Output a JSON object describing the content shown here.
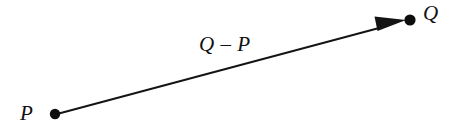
{
  "figure": {
    "type": "vector-diagram",
    "background_color": "#ffffff",
    "stroke_color": "#141414",
    "width": 462,
    "height": 134,
    "labels": {
      "start_point": "P",
      "end_point": "Q",
      "vector": "Q – P"
    },
    "points": [
      {
        "name": "P",
        "x": 55,
        "y": 114,
        "radius": 5.2,
        "label": "P"
      },
      {
        "name": "Q",
        "x": 410,
        "y": 20,
        "radius": 5.6,
        "label": "Q"
      }
    ],
    "arrow": {
      "from_x": 57,
      "from_y": 114,
      "to_x": 406,
      "to_y": 20,
      "line_width": 1.9,
      "head_length": 29,
      "head_half_width": 7.5
    }
  }
}
